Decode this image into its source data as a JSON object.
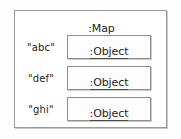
{
  "diagram": {
    "kind": "uml-object-diagram",
    "container": {
      "title": ":Map",
      "border_color": "#9a9a9a",
      "background_color": "#ffffff"
    },
    "entries": [
      {
        "key": "\"abc\"",
        "value": ":Object"
      },
      {
        "key": "\"def\"",
        "value": ":Object"
      },
      {
        "key": "\"ghi\"",
        "value": ":Object"
      }
    ],
    "text_color": "#1d1d1d",
    "page_background": "#fefefe"
  }
}
